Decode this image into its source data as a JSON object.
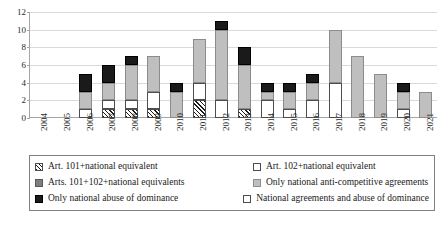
{
  "chart_data": {
    "type": "bar",
    "title": "",
    "subtitle": "",
    "xlabel": "",
    "ylabel": "",
    "stacked": true,
    "grid": true,
    "legend_position": "bottom",
    "ylim": [
      0,
      12
    ],
    "yticks": [
      0,
      2,
      4,
      6,
      8,
      10,
      12
    ],
    "categories": [
      "2004",
      "2005",
      "2006",
      "2007",
      "2008",
      "2009",
      "2010",
      "2011",
      "2012",
      "2013",
      "2014",
      "2015",
      "2016",
      "2017",
      "2018",
      "2019",
      "2020",
      "2021"
    ],
    "series": [
      {
        "name": "Art. 101+national equivalent",
        "key": "art101",
        "pattern": "diagonal-hatch",
        "fill": "#ffffff",
        "values": [
          0,
          0,
          0,
          1,
          1,
          1,
          0,
          2,
          0,
          1,
          0,
          0,
          0,
          0,
          0,
          0,
          0,
          0
        ]
      },
      {
        "name": "Art. 102+national equivalent",
        "key": "art102",
        "pattern": "dotted",
        "fill": "#ffffff",
        "values": [
          0,
          0,
          1,
          1,
          1,
          2,
          0,
          2,
          2,
          0,
          2,
          1,
          2,
          4,
          0,
          0,
          1,
          0
        ]
      },
      {
        "name": "Arts. 101+102+national equivalents",
        "key": "arts101_102",
        "pattern": "solid",
        "fill": "#7f7f7f",
        "values": [
          0,
          0,
          0,
          0,
          0,
          0,
          0,
          0,
          0,
          0,
          0,
          0,
          0,
          0,
          0,
          0,
          0,
          0
        ]
      },
      {
        "name": "Only national anti-competitive agreements",
        "key": "national_agreements",
        "pattern": "solid",
        "fill": "#bfbfbf",
        "values": [
          0,
          0,
          2,
          2,
          4,
          4,
          3,
          5,
          8,
          5,
          1,
          2,
          2,
          6,
          7,
          5,
          2,
          3
        ]
      },
      {
        "name": "Only national abuse of dominance",
        "key": "national_abuse",
        "pattern": "solid",
        "fill": "#1a1a1a",
        "values": [
          0,
          0,
          2,
          2,
          1,
          0,
          1,
          0,
          1,
          2,
          1,
          1,
          1,
          0,
          0,
          0,
          1,
          0
        ]
      },
      {
        "name": "National agreements  and abuse of dominance",
        "key": "national_both",
        "pattern": "empty",
        "fill": "#ffffff",
        "values": [
          0,
          0,
          0,
          0,
          0,
          0,
          0,
          0,
          0,
          0,
          0,
          0,
          0,
          0,
          0,
          0,
          0,
          0
        ]
      }
    ],
    "totals": [
      0,
      0,
      5,
      6,
      7,
      7,
      4,
      9,
      11,
      8,
      4,
      4,
      5,
      10,
      7,
      5,
      4,
      3
    ]
  },
  "legend": {
    "rows": [
      [
        {
          "label": "Art. 101+national equivalent",
          "swatch": "art101"
        },
        {
          "label": "Art. 102+national equivalent",
          "swatch": "art102"
        }
      ],
      [
        {
          "label": "Arts. 101+102+national equivalents",
          "swatch": "arts101_102"
        },
        {
          "label": "Only national anti-competitive agreements",
          "swatch": "national_agreements"
        }
      ],
      [
        {
          "label": "Only national abuse of dominance",
          "swatch": "national_abuse"
        },
        {
          "label": "National agreements  and abuse of dominance",
          "swatch": "national_both"
        }
      ]
    ]
  }
}
